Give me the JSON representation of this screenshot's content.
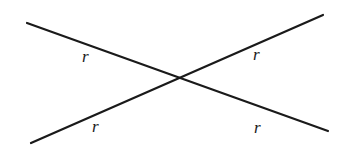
{
  "diagram": {
    "type": "intersecting-lines",
    "line_color": "#1a1a1a",
    "lines": [
      {
        "id": "line-1",
        "x1": 27,
        "y1": 23,
        "x2": 328,
        "y2": 131
      },
      {
        "id": "line-2",
        "x1": 31,
        "y1": 143,
        "x2": 323,
        "y2": 15
      }
    ],
    "labels": [
      {
        "text": "r",
        "x": 82,
        "y": 62
      },
      {
        "text": "r",
        "x": 92,
        "y": 132
      },
      {
        "text": "r",
        "x": 253,
        "y": 60
      },
      {
        "text": "r",
        "x": 254,
        "y": 133
      }
    ]
  }
}
